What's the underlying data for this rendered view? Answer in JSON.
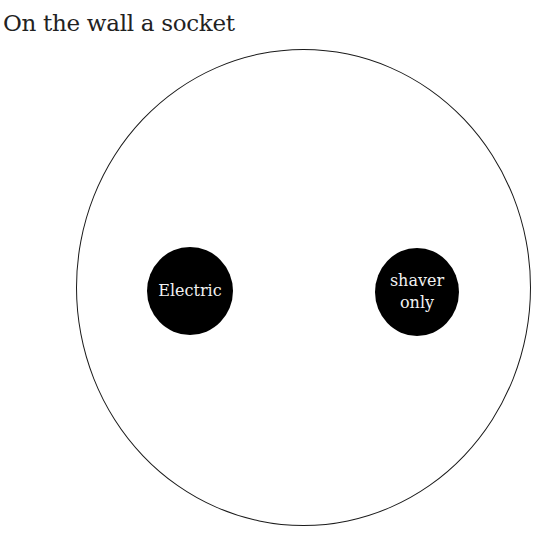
{
  "title": "On the wall a socket",
  "socket": {
    "outline_color": "#1a1a1a",
    "left_hole": {
      "label": "Electric",
      "fill": "#000000",
      "text_color": "#f2f2f2"
    },
    "right_hole": {
      "label_line1": "shaver",
      "label_line2": "only",
      "fill": "#000000",
      "text_color": "#f2f2f2"
    }
  }
}
